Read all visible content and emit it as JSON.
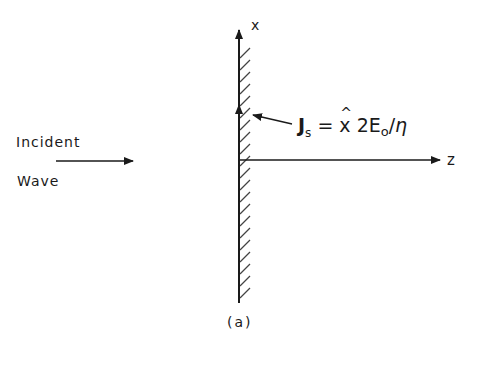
{
  "figure": {
    "caption": "(a)",
    "axes": {
      "x_label": "x",
      "z_label": "z"
    },
    "incident_wave": {
      "line1": "Incident",
      "line2": "Wave"
    },
    "equation": {
      "J": "J",
      "J_sub": "s",
      "equals": " = ",
      "x_hat_char": "x",
      "hat": "^",
      "coef": " 2E",
      "E_sub": "o",
      "slash": "/",
      "eta": "η"
    },
    "colors": {
      "ink": "#1a1a1a",
      "hatch": "#444444",
      "background": "#ffffff"
    }
  }
}
